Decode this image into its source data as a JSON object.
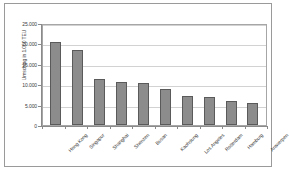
{
  "chart_data": {
    "type": "bar",
    "title": "",
    "subtitle": "",
    "xlabel": "",
    "ylabel": "Umschlag in 1.000 TEU",
    "ylim": [
      0,
      25000
    ],
    "ytick_step": 5000,
    "ytick_labels": [
      "25.000",
      "20.000",
      "15.000",
      "10.000",
      "5.000",
      "0"
    ],
    "ytick_values": [
      25000,
      20000,
      15000,
      10000,
      5000,
      0
    ],
    "grid": true,
    "legend": false,
    "legend_position": "none",
    "bar_fill_color": "#8c8c8c",
    "bar_border_color": "#5a5a5a",
    "gridline_color": "#d2d2d2",
    "axis_color": "#8a8a8a",
    "frame_color": "#9a9a9a",
    "categories": [
      "Hong Kong",
      "Singapur",
      "Shanghai",
      "Shenzen",
      "Busan",
      "Kaohsiung",
      "Los Angeles",
      "Rotterdam",
      "Hamburg",
      "Antwerpen"
    ],
    "values": [
      20400,
      18400,
      11200,
      10600,
      10300,
      8800,
      7100,
      6900,
      5900,
      5400
    ],
    "unit": "1.000 TEU"
  }
}
